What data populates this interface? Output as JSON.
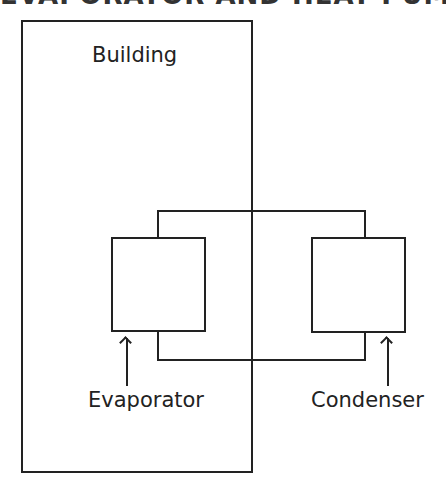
{
  "heading": {
    "text": "EVAPORATOR AND HEAT PUMP",
    "clipped": true
  },
  "diagram": {
    "building": {
      "label": "Building"
    },
    "evaporator": {
      "label": "Evaporator"
    },
    "condenser": {
      "label": "Condenser"
    },
    "colors": {
      "line": "#222222",
      "background": "#ffffff"
    }
  }
}
